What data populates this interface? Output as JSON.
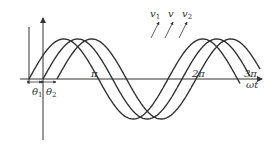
{
  "diagram": {
    "axis": {
      "x_label": "ωt"
    },
    "ticks": [
      {
        "label": "π",
        "x": 95
      },
      {
        "label": "2π",
        "x": 198
      },
      {
        "label": "3π",
        "x": 250
      }
    ],
    "angles": [
      {
        "label": "θ",
        "sub": "1"
      },
      {
        "label": "θ",
        "sub": "2"
      }
    ],
    "waves": [
      {
        "name": "v",
        "sub": "1",
        "start_x": 29
      },
      {
        "name": "v",
        "sub": "",
        "start_x": 43
      },
      {
        "name": "v",
        "sub": "2",
        "start_x": 57
      }
    ],
    "colors": {
      "stroke": "#333333",
      "background": "#ffffff"
    }
  }
}
